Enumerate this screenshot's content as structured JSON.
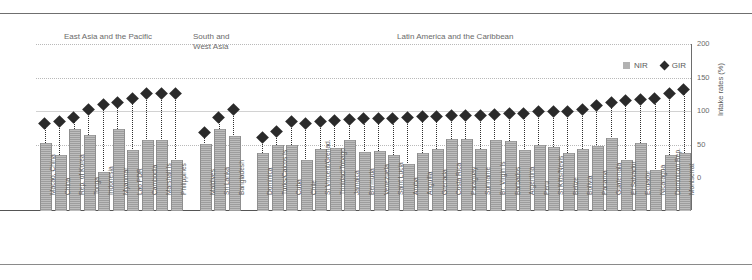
{
  "axis": {
    "y_label": "Intake rates (%)",
    "ticks": [
      "200",
      "150",
      "100",
      "50",
      "0"
    ]
  },
  "legend": [
    {
      "key": "nir",
      "label": "NIR",
      "marker": "square-swatch",
      "color": "#b2b2b2"
    },
    {
      "key": "gir",
      "label": "GIR",
      "marker": "diamond-marker",
      "color": "#2b2b2b"
    }
  ],
  "groups": [
    {
      "id": "east-asia-pacific",
      "label": "East Asia and the Pacific"
    },
    {
      "id": "south-west-asia",
      "label": "South and\nWest Asia"
    },
    {
      "id": "latin-america-caribbean",
      "label": "Latin America and the Caribbean"
    }
  ],
  "chart_data": {
    "type": "bar",
    "title": "",
    "xlabel": "",
    "ylabel": "Intake rates (%)",
    "ylim": [
      0,
      200
    ],
    "yticks": [
      0,
      50,
      100,
      150,
      200
    ],
    "grid": true,
    "legend_position": "top-right",
    "categories": [
      "Macao, China",
      "China",
      "Rep. of Korea",
      "Tonga",
      "Indonesia",
      "Myanmar",
      "Lao PDR",
      "Cambodia",
      "Marshall Is",
      "Philippines",
      "Maldives",
      "Sri Lanka",
      "Bangladesh",
      "Dominica",
      "Turks/Caicos Is",
      "Cuba",
      "Chile",
      "St Vincent/Grenad.",
      "Trinidad/Tobago",
      "Jamaica",
      "Bermuda",
      "Venezuela",
      "Saint Lucia",
      "Aruba",
      "Anguilla",
      "Grenada",
      "Costa Rica",
      "Paraguay",
      "Suriname",
      "Br. Virgin Is",
      "Barbados",
      "Argentina",
      "Peru",
      "St Kitts/Nevis",
      "Belize",
      "Bolivia",
      "Panama",
      "Guatemala",
      "El Salvador",
      "Ecuador",
      "Nicaragua",
      "Dominican Rep.",
      "Montserrat"
    ],
    "group_spans": [
      {
        "group": "East Asia and the Pacific",
        "start": 0,
        "end": 9
      },
      {
        "group": "South and West Asia",
        "start": 10,
        "end": 12
      },
      {
        "group": "Latin America and the Caribbean",
        "start": 13,
        "end": 42
      }
    ],
    "series": [
      {
        "name": "NIR",
        "type": "bar",
        "color": "#a8a8a8",
        "values": [
          82,
          68,
          99,
          92,
          47,
          99,
          74,
          85,
          85,
          62,
          81,
          99,
          90,
          70,
          79,
          79,
          62,
          75,
          76,
          86,
          71,
          72,
          68,
          57,
          70,
          75,
          87,
          87,
          75,
          85,
          84,
          74,
          79,
          77,
          70,
          75,
          78,
          88,
          61,
          82,
          50,
          67,
          70
        ]
      },
      {
        "name": "GIR",
        "type": "scatter-diamond",
        "color": "#2a2a2a",
        "values": [
          106,
          108,
          113,
          122,
          128,
          131,
          136,
          141,
          141,
          141,
          95,
          113,
          122,
          88,
          96,
          108,
          105,
          108,
          109,
          110,
          112,
          112,
          112,
          113,
          114,
          114,
          115,
          115,
          115,
          116,
          118,
          118,
          120,
          120,
          120,
          122,
          127,
          131,
          133,
          134,
          136,
          141,
          147
        ]
      }
    ]
  }
}
